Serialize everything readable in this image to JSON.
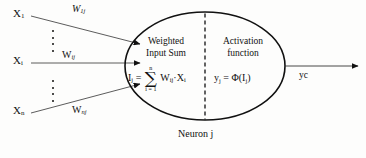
{
  "figure": {
    "caption": "Neuron j",
    "colors": {
      "stroke": "#111111",
      "background": "#fdfdfc",
      "text": "#111111"
    }
  },
  "inputs": [
    {
      "label": "X",
      "sub": "1",
      "weight_label": "W",
      "weight_sub": "1j",
      "weight_italic": true
    },
    {
      "label": "X",
      "sub": "i",
      "weight_label": "W",
      "weight_sub": "ij",
      "weight_italic": false
    },
    {
      "label": "X",
      "sub": "n",
      "weight_label": "W",
      "weight_sub": "nj",
      "weight_italic": false
    }
  ],
  "neuron": {
    "left_cell": {
      "heading_line1": "Weighted",
      "heading_line2": "Input Sum",
      "formula": {
        "lhs": "I",
        "lhs_sub": "j",
        "equals": "=",
        "sigma_upper": "n",
        "sigma_symbol": "∑",
        "sigma_lower": "i = 1",
        "term": "W",
        "term_sub": "ij",
        "dot": "·",
        "term2": "X",
        "term2_sub": "i"
      }
    },
    "right_cell": {
      "heading_line1": "Activation",
      "heading_line2": "function",
      "formula": {
        "lhs": "y",
        "lhs_sub": "j",
        "equals": "=",
        "phi": "Φ",
        "open": "(",
        "arg": "I",
        "arg_sub": "j",
        "close": ")"
      }
    }
  },
  "output": {
    "label": "yc"
  }
}
